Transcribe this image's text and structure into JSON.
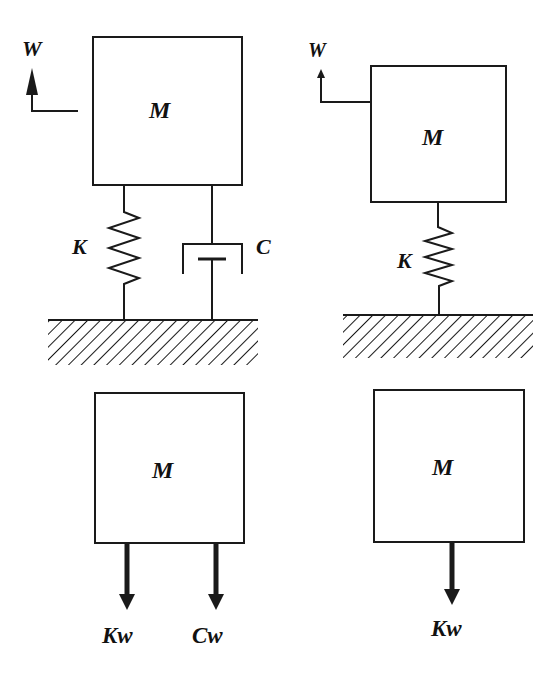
{
  "figure": {
    "left_system": {
      "mass_label": "M",
      "input_label": "W",
      "spring_label": "K",
      "damper_label": "C"
    },
    "right_system": {
      "mass_label": "M",
      "input_label": "W",
      "spring_label": "K"
    },
    "left_free_body": {
      "mass_label": "M",
      "forces": [
        "Kw",
        "Cw"
      ]
    },
    "right_free_body": {
      "mass_label": "M",
      "forces": [
        "Kw"
      ]
    }
  },
  "colors": {
    "stroke": "#1a1a1a",
    "background": "#ffffff"
  }
}
